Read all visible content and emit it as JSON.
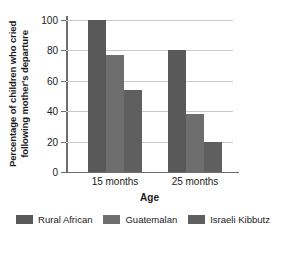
{
  "chart_data": {
    "type": "bar",
    "title": "",
    "subtitle": "",
    "xlabel": "Age",
    "ylabel": "Percentage of children who cried following mother's departure",
    "ylabel_line1": "Percentage of children who cried",
    "ylabel_line2": "following mother's departure",
    "categories": [
      "15 months",
      "25 months"
    ],
    "series": [
      {
        "name": "Rural African",
        "values": [
          100,
          80
        ],
        "color": "#595959"
      },
      {
        "name": "Guatemalan",
        "values": [
          77,
          38
        ],
        "color": "#6e6e6e"
      },
      {
        "name": "Israeli Kibbutz",
        "values": [
          54,
          20
        ],
        "color": "#5f5f5f"
      }
    ],
    "ylim": [
      0,
      100
    ],
    "ytick_labels": [
      "0",
      "20",
      "40",
      "60",
      "80",
      "100"
    ],
    "ytick_values": [
      0,
      20,
      40,
      60,
      80,
      100
    ],
    "grid": true,
    "grid_color": "#c9c9c9",
    "axis_color": "#6d6d6d",
    "legend_position": "bottom",
    "background": "#ffffff"
  }
}
